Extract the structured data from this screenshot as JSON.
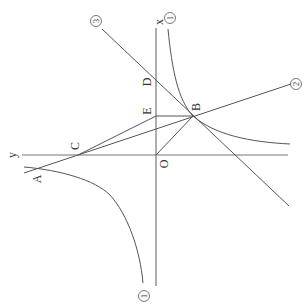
{
  "figure": {
    "rotation_deg": -90,
    "colors": {
      "stroke": "#555555",
      "text": "#333333",
      "background": "#ffffff"
    },
    "axes": {
      "x_label": "x",
      "y_label": "y",
      "origin_label": "O"
    },
    "points": {
      "A": {
        "label": "A"
      },
      "B": {
        "label": "B"
      },
      "C": {
        "label": "C"
      },
      "D": {
        "label": "D"
      },
      "E": {
        "label": "E"
      },
      "O": {
        "label": "O"
      }
    },
    "curves": {
      "hyperbola": {
        "label": "①",
        "label_top": "①",
        "label_bottom": "①"
      },
      "line2": {
        "label": "②"
      },
      "line3": {
        "label": "③"
      }
    }
  }
}
